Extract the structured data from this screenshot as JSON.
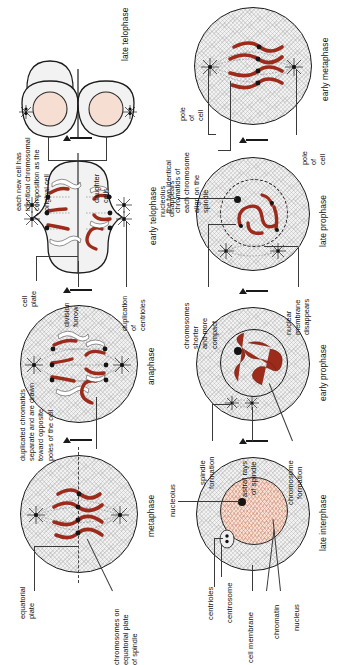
{
  "figure": {
    "colors": {
      "chromosome": "#9c2b1c",
      "nucleoplasm": "#f6ded2",
      "cytoplasm": "#f2f2f2",
      "outline": "#1c1c1c"
    }
  },
  "row_top": {
    "stages": [
      {
        "id": "late-interphase",
        "caption": "late interphase",
        "labels": [
          {
            "id": "cell-membrane",
            "text": "cell membrane"
          },
          {
            "id": "chromatin",
            "text": "chromatin"
          },
          {
            "id": "nucleus",
            "text": "nucleus"
          },
          {
            "id": "centrioles",
            "text": "centrioles"
          },
          {
            "id": "centrosome",
            "text": "centrosome"
          },
          {
            "id": "nucleolus",
            "text": "nucleolus"
          }
        ]
      },
      {
        "id": "early-prophase",
        "caption": "early prophase",
        "labels": [
          {
            "id": "spindle-formation",
            "text": "spindle\nformation"
          },
          {
            "id": "astral-rays",
            "text": "astral rays\nof spindle"
          },
          {
            "id": "chromosome-formation",
            "text": "chromosome\nformation"
          }
        ]
      },
      {
        "id": "late-prophase",
        "caption": "late prophase",
        "labels": [
          {
            "id": "nuclear-membrane-disappears",
            "text": "nuclear\nmembrane\ndisappears"
          },
          {
            "id": "chromosomes-shorter",
            "text": "chromosomes\nshorter\nand more\ncompact"
          },
          {
            "id": "nucleolus-disappears",
            "text": "nucleolus\ndisappears"
          }
        ]
      },
      {
        "id": "early-metaphase",
        "caption": "early metaphase",
        "labels": [
          {
            "id": "pole-of-cell-lower",
            "text": "pole\nof\ncell"
          },
          {
            "id": "pole-of-cell-upper",
            "text": "pole\nof\ncell"
          },
          {
            "id": "two-chromatids",
            "text": "the two identical\nchromatids of\neach chromosome\nalign on the\nspindle"
          }
        ]
      }
    ]
  },
  "row_bottom": {
    "stages": [
      {
        "id": "metaphase",
        "caption": "metaphase",
        "labels": [
          {
            "id": "chromosomes-on-equatorial-plate",
            "text": "chromosomes on\nequatorial plate\nof spindle"
          },
          {
            "id": "equatorial-plate",
            "text": "equatorial\nplate"
          }
        ]
      },
      {
        "id": "anaphase",
        "caption": "anaphase",
        "labels": [
          {
            "id": "duplicated-chromatids",
            "text": "duplicated chromatids\nseparate and are drawn\ntoward opposite\npoles of the cell"
          }
        ]
      },
      {
        "id": "early-telophase",
        "caption": "early telophase",
        "labels": [
          {
            "id": "duplication-of-centrioles",
            "text": "duplication\nof\ncentrioles"
          },
          {
            "id": "division-furrow",
            "text": "division\nfurrow"
          },
          {
            "id": "cell-plate",
            "text": "cell\nplate"
          }
        ]
      },
      {
        "id": "late-telophase",
        "caption": "late telophase",
        "labels": [
          {
            "id": "daughter-cells",
            "text": "daughter\ncells"
          },
          {
            "id": "each-new-cell",
            "text": "each new cell has\nidentical chromosomal\ncomposition as the\noriginal cell"
          }
        ]
      }
    ]
  }
}
